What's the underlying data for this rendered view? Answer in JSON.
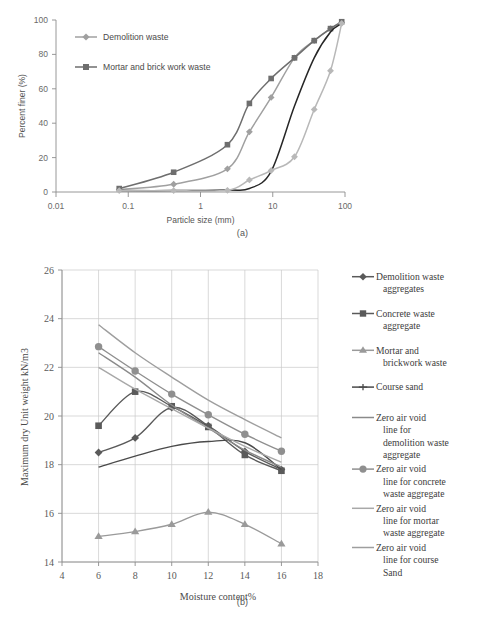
{
  "figure": {
    "caption_a": "(a)",
    "caption_b": "(b)"
  },
  "colors": {
    "demolition_waste": "#a0a0a0",
    "mortar_brick_waste": "#6e6e6e",
    "unlabeled_dark": "#262626",
    "unlabeled_light": "#b8b8b8",
    "concrete_waste": "#5a5a5a",
    "mortar_brickwork": "#9a9a9a",
    "course_sand": "#4a4a4a",
    "zav_demolition": "#8a8a8a",
    "zav_concrete": "#8f8f8f",
    "zav_mortar": "#a8a8a8",
    "zav_course_sand": "#9e9e9e",
    "grid": "#c9c9c9",
    "axis": "#8d8d8d",
    "text": "#4a4a4a",
    "background": "#ffffff"
  },
  "chart_data": [
    {
      "id": "panel-a",
      "type": "line",
      "title": "",
      "xlabel": "Particle size (mm)",
      "ylabel": "Percent finer (%)",
      "xscale": "log",
      "xlim": [
        0.01,
        100
      ],
      "ylim": [
        0,
        100
      ],
      "xticks": [
        "0.01",
        "0.1",
        "1",
        "10",
        "100"
      ],
      "yticks": [
        "0",
        "20",
        "40",
        "60",
        "80",
        "100"
      ],
      "grid": false,
      "legend_position": "upper-left-inside",
      "legend": [
        {
          "label": "Demolition waste",
          "marker": "diamond",
          "color": "#a0a0a0"
        },
        {
          "label": "Mortar and brick work waste",
          "marker": "square",
          "color": "#6e6e6e"
        }
      ],
      "series": [
        {
          "name": "Demolition waste",
          "marker": "diamond",
          "color": "#a0a0a0",
          "points": [
            [
              0.075,
              1.5
            ],
            [
              0.425,
              4.5
            ],
            [
              2.36,
              13.5
            ],
            [
              4.75,
              35
            ],
            [
              9.5,
              55
            ],
            [
              20,
              78
            ],
            [
              37.5,
              88
            ],
            [
              63,
              95
            ],
            [
              90,
              98.5
            ]
          ]
        },
        {
          "name": "Mortar and brick work waste",
          "marker": "square",
          "color": "#6e6e6e",
          "points": [
            [
              0.075,
              2
            ],
            [
              0.425,
              11.5
            ],
            [
              2.36,
              27.5
            ],
            [
              4.75,
              51.5
            ],
            [
              9.5,
              66
            ],
            [
              20,
              78
            ],
            [
              37.5,
              88
            ],
            [
              63,
              95
            ],
            [
              90,
              99
            ]
          ]
        },
        {
          "name": "unlabeled-dark-curve",
          "marker": "none",
          "color": "#262626",
          "points": [
            [
              0.075,
              0.8
            ],
            [
              0.425,
              0.8
            ],
            [
              2.36,
              1.2
            ],
            [
              4.75,
              2
            ],
            [
              9.5,
              12
            ],
            [
              20,
              50
            ],
            [
              37.5,
              78
            ],
            [
              63,
              93
            ],
            [
              90,
              98
            ]
          ]
        },
        {
          "name": "unlabeled-light-curve",
          "marker": "diamond",
          "color": "#b8b8b8",
          "points": [
            [
              0.075,
              0.8
            ],
            [
              0.425,
              0.8
            ],
            [
              2.36,
              1.0
            ],
            [
              4.75,
              7
            ],
            [
              9.5,
              12.5
            ],
            [
              20,
              20.5
            ],
            [
              37.5,
              48
            ],
            [
              63,
              70.5
            ],
            [
              90,
              98
            ]
          ]
        }
      ]
    },
    {
      "id": "panel-b",
      "type": "line",
      "title": "",
      "xlabel": "Moisture content%",
      "ylabel": "Maximum dry Unit weight kN/m3",
      "xscale": "linear",
      "xlim": [
        4,
        18
      ],
      "ylim": [
        14,
        26
      ],
      "xticks": [
        "4",
        "6",
        "8",
        "10",
        "12",
        "14",
        "16",
        "18"
      ],
      "yticks": [
        "14",
        "16",
        "18",
        "20",
        "22",
        "24",
        "26"
      ],
      "grid": true,
      "legend_position": "right",
      "x": [
        6,
        8,
        10,
        12,
        14,
        16
      ],
      "legend": [
        {
          "label": "Demolition waste aggregates",
          "marker": "diamond",
          "color": "#5a5a5a"
        },
        {
          "label": "Concrete waste aggregate",
          "marker": "square",
          "color": "#5a5a5a"
        },
        {
          "label": "Mortar and brickwork waste",
          "marker": "triangle",
          "color": "#9a9a9a"
        },
        {
          "label": "Course sand",
          "marker": "cross",
          "color": "#4a4a4a"
        },
        {
          "label": "Zero air void line for demolition waste aggregate",
          "marker": "none",
          "color": "#8a8a8a"
        },
        {
          "label": "Zero air void line for concrete waste aggregate",
          "marker": "circle",
          "color": "#8f8f8f"
        },
        {
          "label": "Zero air void line for mortar waste aggregate",
          "marker": "none",
          "color": "#a8a8a8"
        },
        {
          "label": "Zero air void line for course Sand",
          "marker": "none",
          "color": "#9e9e9e"
        }
      ],
      "series": [
        {
          "name": "Demolition waste aggregates",
          "marker": "diamond",
          "color": "#5a5a5a",
          "values": [
            18.5,
            19.1,
            20.35,
            19.6,
            18.55,
            17.8
          ]
        },
        {
          "name": "Concrete waste aggregate",
          "marker": "square",
          "color": "#5a5a5a",
          "values": [
            19.6,
            21.0,
            20.4,
            19.55,
            18.4,
            17.75
          ]
        },
        {
          "name": "Mortar and brickwork waste",
          "marker": "triangle",
          "color": "#9a9a9a",
          "values": [
            15.05,
            15.25,
            15.55,
            16.05,
            15.55,
            14.75
          ]
        },
        {
          "name": "Course sand",
          "marker": "none",
          "color": "#4a4a4a",
          "values": [
            17.9,
            18.35,
            18.75,
            18.95,
            18.9,
            17.8
          ]
        },
        {
          "name": "Zero air void line for demolition waste aggregate",
          "marker": "none",
          "color": "#8a8a8a",
          "values": [
            22.6,
            21.6,
            20.45,
            19.5,
            18.6,
            17.9
          ]
        },
        {
          "name": "Zero air void line for concrete waste aggregate",
          "marker": "circle",
          "color": "#8f8f8f",
          "values": [
            22.85,
            21.85,
            20.9,
            20.05,
            19.25,
            18.55
          ]
        },
        {
          "name": "Zero air void line for mortar waste aggregate",
          "marker": "none",
          "color": "#a8a8a8",
          "values": [
            22.0,
            21.1,
            20.3,
            19.5,
            18.75,
            18.1
          ]
        },
        {
          "name": "Zero air void line for course Sand",
          "marker": "none",
          "color": "#9e9e9e",
          "values": [
            23.75,
            22.6,
            21.6,
            20.65,
            19.85,
            19.1
          ]
        }
      ]
    }
  ]
}
